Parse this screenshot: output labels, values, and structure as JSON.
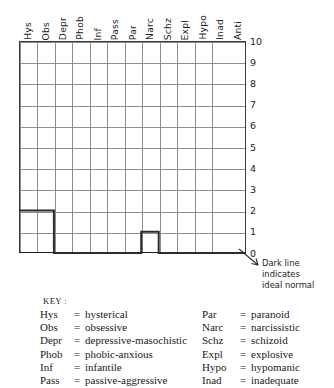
{
  "chart_data": {
    "type": "bar",
    "title": "",
    "xlabel": "",
    "ylabel": "",
    "ylim": [
      0,
      10
    ],
    "grid": true,
    "categories": [
      "Hys",
      "Obs",
      "Depr",
      "Phob",
      "Inf",
      "Pass",
      "Par",
      "Narc",
      "Schz",
      "Expl",
      "Hypo",
      "Inad",
      "Anti"
    ],
    "series": [
      {
        "name": "Dark line indicates ideal normal",
        "values": [
          2,
          2,
          0,
          0,
          0,
          0,
          0,
          1,
          0,
          0,
          0,
          0,
          0
        ]
      }
    ],
    "ytick_labels": [
      "10",
      "9",
      "8",
      "7",
      "6",
      "5",
      "4",
      "3",
      "2",
      "1",
      "0"
    ],
    "annotation": "Dark line indicates ideal normal"
  },
  "headers": [
    "Hys",
    "Obs",
    "Depr",
    "Phob",
    "Inf",
    "Pass",
    "Par",
    "Narc",
    "Schz",
    "Expl",
    "Hypo",
    "Inad",
    "Anti"
  ],
  "yticks": [
    "10",
    "9",
    "8",
    "7",
    "6",
    "5",
    "4",
    "3",
    "2",
    "1",
    "0"
  ],
  "annotation": {
    "line1": "Dark line",
    "line2": "indicates",
    "line3": "ideal normal"
  },
  "key": {
    "title": "KEY :",
    "left": [
      {
        "abbr": "Hys",
        "eq": "=",
        "def": "hysterical"
      },
      {
        "abbr": "Obs",
        "eq": "=",
        "def": "obsessive"
      },
      {
        "abbr": "Depr",
        "eq": "=",
        "def": "depressive-masochistic"
      },
      {
        "abbr": "Phob",
        "eq": "=",
        "def": "phobic-anxious"
      },
      {
        "abbr": "Inf",
        "eq": "=",
        "def": "infantile"
      },
      {
        "abbr": "Pass",
        "eq": "=",
        "def": "passive-aggressive"
      }
    ],
    "right": [
      {
        "abbr": "Par",
        "eq": "=",
        "def": "paranoid"
      },
      {
        "abbr": "Narc",
        "eq": "=",
        "def": "narcissistic"
      },
      {
        "abbr": "Schz",
        "eq": "=",
        "def": "schizoid"
      },
      {
        "abbr": "Expl",
        "eq": "=",
        "def": "explosive"
      },
      {
        "abbr": "Hypo",
        "eq": "=",
        "def": "hypomanic"
      },
      {
        "abbr": "Inad",
        "eq": "=",
        "def": "inadequate"
      }
    ]
  },
  "colors": {
    "ink": "#1a1a1a",
    "gridline": "#8d8d8d",
    "ideal_line": "#2b2b2b",
    "background": "#ffffff"
  }
}
